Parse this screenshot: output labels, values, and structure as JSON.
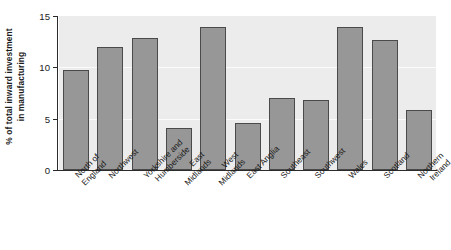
{
  "chart_data": {
    "type": "bar",
    "title": "",
    "subtitle": "",
    "xlabel": "",
    "ylabel": "% of total inward investment in manufacturing",
    "ylabel_lines": [
      "% of total inward investment",
      "in manufacturing"
    ],
    "ylim": [
      0,
      15
    ],
    "yticks": [
      0,
      5,
      10,
      15
    ],
    "ytick_labels": [
      "0",
      "5",
      "10",
      "15"
    ],
    "grid": true,
    "grid_axis": "y",
    "legend": "none",
    "categories": [
      "North of\nEngland",
      "Northwest",
      "Yorkshire and\nHumberside",
      "East\nMidlands",
      "West\nMidlands",
      "East Anglia",
      "Southeast",
      "Southwest",
      "Wales",
      "Scotland",
      "Northern\nIreland"
    ],
    "values": [
      9.7,
      12.0,
      12.9,
      4.1,
      13.9,
      4.6,
      7.0,
      6.8,
      13.9,
      12.7,
      5.8
    ],
    "bar_color": "#979797",
    "bar_edge_color": "#4a4a4a",
    "plot_background": "#ececec",
    "gridline_color": "#fbfbfb",
    "axis_color": "#2b2b2b",
    "text_color": "#1a1a1a"
  }
}
